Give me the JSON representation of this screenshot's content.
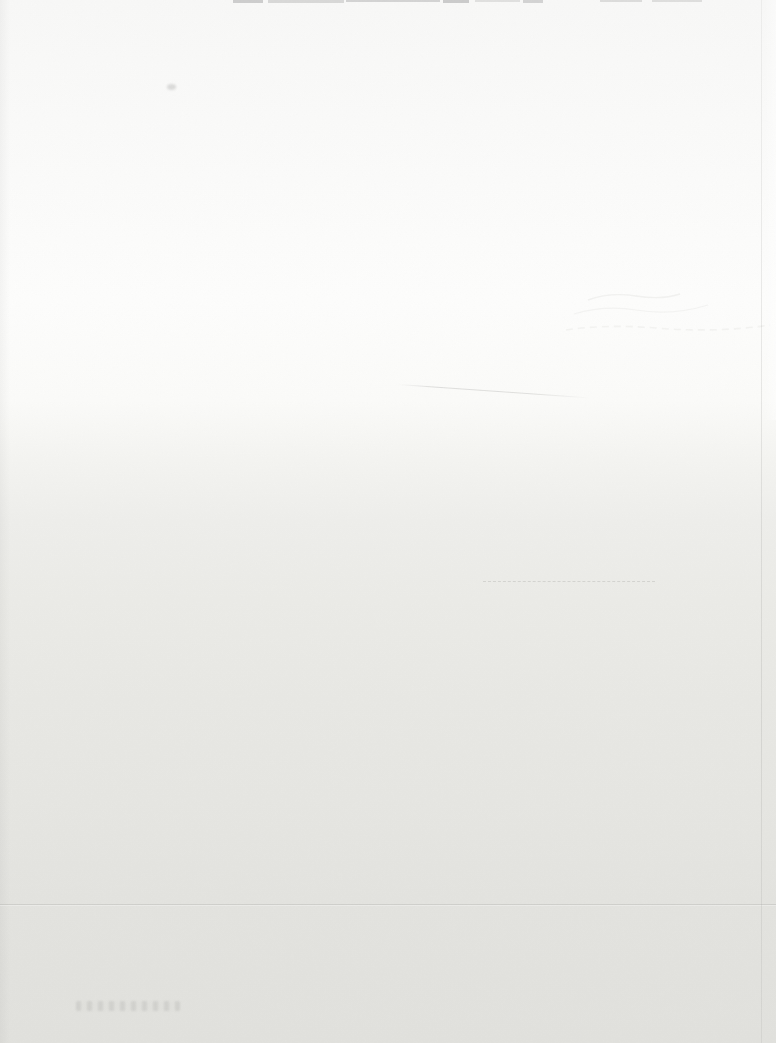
{
  "colors": {
    "page_top": "#f8f8f7",
    "page_highlight": "#fdfdfc",
    "page_bottom": "#e1e1dd",
    "artifact_gray": "#8f8f8f"
  },
  "artifacts": {
    "top_edge_text_remnant": "cropped-text-fragments-at-top-edge",
    "small_smudge": "tiny-faint-smudge",
    "diagonal_scratch": "faint-diagonal-hairline-scratch",
    "show_through_marks": "faint-wavy-show-through-marks",
    "dotted_smudge_row": "faint-dashed-smudge-row",
    "horizontal_crease": "faint-full-width-crease",
    "vertical_fold": "faint-vertical-fold-line",
    "watermark_smudge": "illegible-faint-text-smudge"
  }
}
